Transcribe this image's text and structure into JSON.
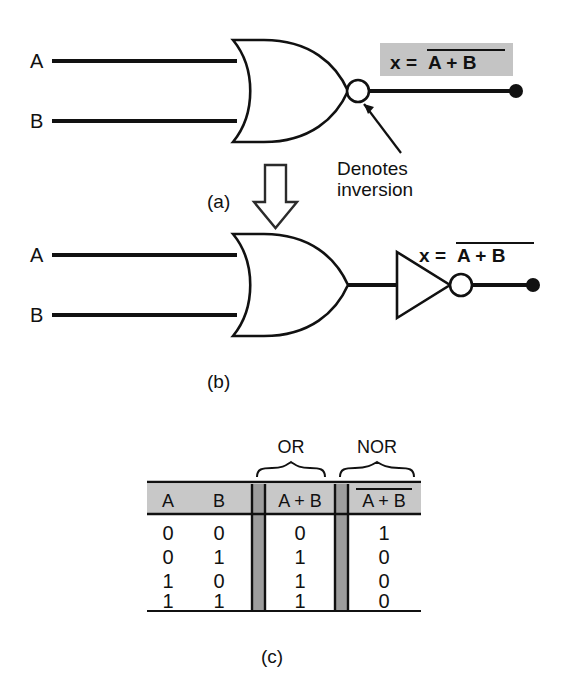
{
  "figure": {
    "colors": {
      "ink": "#111111",
      "shade_light": "#c8c8c8",
      "shade_separator": "#9d9d9d",
      "background": "#ffffff"
    }
  },
  "panel_a": {
    "part_label": "(a)",
    "input_labels": [
      "A",
      "B"
    ],
    "output_expression": {
      "lhs": "x",
      "equals": "=",
      "rhs": "A + B",
      "overbar": true,
      "highlighted": true
    },
    "annotation": {
      "line1": "Denotes",
      "line2": "inversion"
    },
    "gate": {
      "type": "nor-gate",
      "has_inversion_bubble": true
    }
  },
  "transform_arrow": {
    "icon": "down-arrow-icon",
    "direction": "down"
  },
  "panel_b": {
    "part_label": "(b)",
    "input_labels": [
      "A",
      "B"
    ],
    "output_expression": {
      "lhs": "x",
      "equals": "=",
      "rhs": "A + B",
      "overbar": true,
      "highlighted": false
    },
    "gates": [
      {
        "type": "or-gate",
        "has_inversion_bubble": false
      },
      {
        "type": "inverter-gate",
        "has_inversion_bubble": true
      }
    ]
  },
  "panel_c": {
    "part_label": "(c)",
    "group_labels": [
      "OR",
      "NOR"
    ],
    "table": {
      "headers": [
        "A",
        "B",
        "A + B",
        "A + B"
      ],
      "header_overbars": [
        false,
        false,
        false,
        true
      ],
      "rows": [
        [
          "0",
          "0",
          "0",
          "1"
        ],
        [
          "0",
          "1",
          "1",
          "0"
        ],
        [
          "1",
          "0",
          "1",
          "0"
        ],
        [
          "1",
          "1",
          "1",
          "0"
        ]
      ]
    }
  }
}
